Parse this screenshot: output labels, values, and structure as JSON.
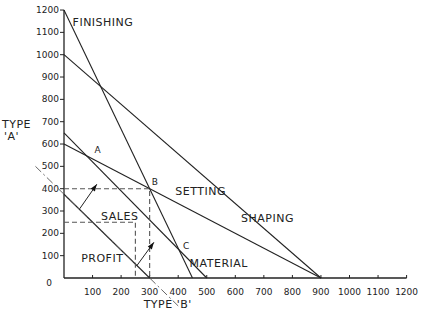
{
  "chart_data": {
    "type": "line",
    "title": "",
    "xlabel": "TYPE 'B'",
    "ylabel": "TYPE 'A'",
    "xlim": [
      0,
      1200
    ],
    "ylim": [
      0,
      1200
    ],
    "grid": false,
    "x_ticks": [
      100,
      200,
      300,
      400,
      500,
      600,
      700,
      800,
      900,
      1000,
      1100,
      1200
    ],
    "y_ticks": [
      100,
      200,
      300,
      400,
      500,
      600,
      700,
      800,
      900,
      1000,
      1100,
      1200
    ],
    "origin_label": "0",
    "series": [
      {
        "name": "FINISHING",
        "style": "solid",
        "points": [
          [
            0,
            1200
          ],
          [
            450,
            0
          ]
        ]
      },
      {
        "name": "SHAPING",
        "style": "solid",
        "points": [
          [
            0,
            1000
          ],
          [
            900,
            0
          ]
        ]
      },
      {
        "name": "SETTING",
        "style": "solid",
        "points": [
          [
            0,
            600
          ],
          [
            900,
            0
          ]
        ]
      },
      {
        "name": "MATERIAL",
        "style": "solid",
        "points": [
          [
            0,
            650
          ],
          [
            500,
            0
          ]
        ]
      },
      {
        "name": "PROFIT",
        "style": "solid",
        "points": [
          [
            0,
            375
          ],
          [
            300,
            0
          ]
        ]
      },
      {
        "name": "PROFIT extension",
        "style": "dash-dot",
        "points": [
          [
            -100,
            500
          ],
          [
            400,
            -125
          ]
        ]
      },
      {
        "name": "SALES guide 400",
        "style": "dashed",
        "points": [
          [
            0,
            400
          ],
          [
            300,
            400
          ],
          [
            300,
            0
          ]
        ]
      },
      {
        "name": "SALES guide 250",
        "style": "dashed",
        "points": [
          [
            0,
            250
          ],
          [
            250,
            250
          ],
          [
            250,
            0
          ]
        ]
      }
    ],
    "points": [
      {
        "label": "A",
        "x": 100,
        "y": 540
      },
      {
        "label": "B",
        "x": 300,
        "y": 400
      },
      {
        "label": "C",
        "x": 410,
        "y": 110
      }
    ],
    "annotations": [
      {
        "text": "FINISHING",
        "x": 30,
        "y": 1130
      },
      {
        "text": "SETTING",
        "x": 390,
        "y": 370
      },
      {
        "text": "SHAPING",
        "x": 620,
        "y": 250
      },
      {
        "text": "MATERIAL",
        "x": 440,
        "y": 50
      },
      {
        "text": "SALES",
        "x": 130,
        "y": 260
      },
      {
        "text": "PROFIT",
        "x": 60,
        "y": 70
      }
    ],
    "arrows": [
      {
        "from": [
          55,
          310
        ],
        "to": [
          115,
          420
        ],
        "note": "direction of increasing profit"
      },
      {
        "from": [
          255,
          55
        ],
        "to": [
          315,
          160
        ],
        "note": "direction of increasing profit"
      }
    ]
  }
}
